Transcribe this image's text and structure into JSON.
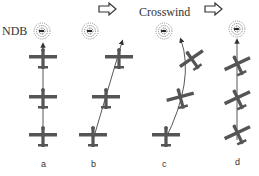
{
  "diagram": {
    "labels": {
      "ndb": "NDB",
      "crosswind": "Crosswind"
    },
    "panels": [
      {
        "id": "a",
        "label": "a",
        "description": "no wind, straight track to NDB"
      },
      {
        "id": "b",
        "label": "b",
        "description": "crosswind drift, heading toward NDB"
      },
      {
        "id": "c",
        "label": "c",
        "description": "homing curve under crosswind"
      },
      {
        "id": "d",
        "label": "d",
        "description": "crab angle correction, straight track"
      }
    ],
    "icons": {
      "wind_arrow": "right-arrow-outline",
      "ndb_beacon": "ndb-beacon-icon",
      "aircraft": "airplane-top-view-icon"
    },
    "colors": {
      "aircraft": "#555555",
      "track": "#444444",
      "text": "#333333",
      "background": "#ffffff"
    }
  }
}
